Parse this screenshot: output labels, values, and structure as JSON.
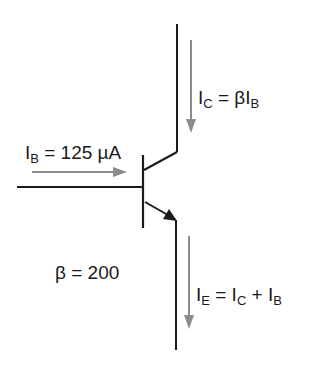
{
  "diagram": {
    "type": "npn-bjt-current-relationships",
    "colors": {
      "wire": "#1a1a1a",
      "current_arrow": "#8c8c8c",
      "background": "#ffffff"
    },
    "labels": {
      "ib": {
        "symbol": "I",
        "sub": "B",
        "rest": " = 125 µA"
      },
      "ic": {
        "symbol": "I",
        "sub": "C",
        "rest": " = βI",
        "sub2": "B"
      },
      "ie": {
        "symbol": "I",
        "sub": "E",
        "rest": " = I",
        "sub2": "C",
        "rest2": " + I",
        "sub3": "B"
      },
      "beta": "β = 200"
    }
  }
}
